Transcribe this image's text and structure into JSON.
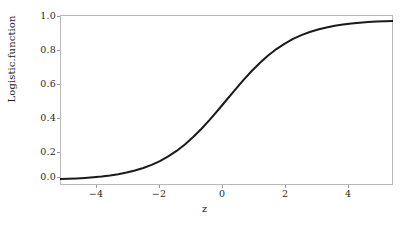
{
  "chart_data": {
    "type": "line",
    "title": "",
    "xlabel": "z",
    "ylabel": "Logistic.function",
    "xlim": [
      -5,
      5
    ],
    "ylim": [
      -0.03,
      1.03
    ],
    "grid": false,
    "legend": null,
    "line_color": "#1a1a1a",
    "line_width": 2,
    "xticks": [
      "−4",
      "−2",
      "0",
      "2",
      "4"
    ],
    "xtick_values": [
      -4,
      -2,
      0,
      2,
      4
    ],
    "yticks": [
      "0.0",
      "0.2",
      "0.4",
      "0.6",
      "0.8",
      "1.0"
    ],
    "ytick_values": [
      0.0,
      0.2,
      0.4,
      0.6,
      0.8,
      1.0
    ],
    "series": [
      {
        "name": "logistic",
        "x": [
          -5.0,
          -4.75,
          -4.5,
          -4.25,
          -4.0,
          -3.75,
          -3.5,
          -3.25,
          -3.0,
          -2.75,
          -2.5,
          -2.25,
          -2.0,
          -1.75,
          -1.5,
          -1.25,
          -1.0,
          -0.75,
          -0.5,
          -0.25,
          0.0,
          0.25,
          0.5,
          0.75,
          1.0,
          1.25,
          1.5,
          1.75,
          2.0,
          2.25,
          2.5,
          2.75,
          3.0,
          3.25,
          3.5,
          3.75,
          4.0,
          4.25,
          4.5,
          4.75,
          5.0
        ],
        "y": [
          0.0067,
          0.0086,
          0.011,
          0.014,
          0.018,
          0.023,
          0.0293,
          0.0373,
          0.0474,
          0.0601,
          0.0759,
          0.0953,
          0.1192,
          0.148,
          0.1824,
          0.2227,
          0.2689,
          0.3208,
          0.3775,
          0.4378,
          0.5,
          0.5622,
          0.6225,
          0.6792,
          0.7311,
          0.7773,
          0.8176,
          0.852,
          0.8808,
          0.9047,
          0.9241,
          0.9399,
          0.9526,
          0.9627,
          0.9707,
          0.977,
          0.982,
          0.986,
          0.989,
          0.9914,
          0.9933
        ]
      }
    ]
  },
  "figure": {
    "background_color": "#ffffff",
    "frame_color": "#b9b9b9",
    "tick_color": "#9a9a9a"
  }
}
